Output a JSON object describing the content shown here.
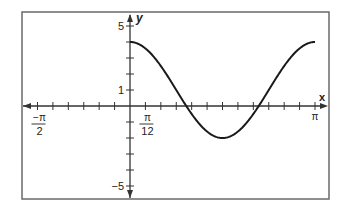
{
  "chart_data": {
    "type": "line",
    "title": "",
    "xlabel": "x",
    "ylabel": "y",
    "function": "y = 3cos(2x) + 1",
    "xlim": [
      -1.5708,
      3.1416
    ],
    "ylim": [
      -5,
      5
    ],
    "x_tick_step": "π/12",
    "y_tick_step": 1,
    "x_tick_labels": [
      {
        "value": -1.5708,
        "label_num": "−π",
        "label_den": "2"
      },
      {
        "value": 0.2618,
        "label_num": "π",
        "label_den": "12"
      },
      {
        "value": 3.1416,
        "label_num": "π",
        "label_den": ""
      }
    ],
    "y_tick_labels": [
      {
        "value": 5,
        "label": "5"
      },
      {
        "value": 1,
        "label": "1"
      },
      {
        "value": -5,
        "label": "−5"
      }
    ],
    "series": [
      {
        "name": "curve",
        "x": [
          0,
          0.2618,
          0.5236,
          0.7854,
          1.0472,
          1.309,
          1.5708,
          1.8326,
          2.0944,
          2.3562,
          2.618,
          2.8798,
          3.1416
        ],
        "values": [
          4,
          3.6,
          2.5,
          1,
          -0.5,
          -1.6,
          -2,
          -1.6,
          -0.5,
          1,
          2.5,
          3.6,
          4
        ]
      }
    ],
    "grid": false,
    "legend": "none",
    "colors": {
      "curve": "#1a1a1a",
      "axes": "#333333",
      "frame": "#666666"
    }
  }
}
